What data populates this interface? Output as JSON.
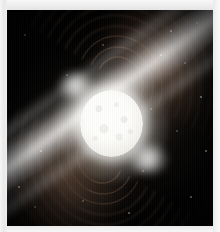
{
  "page": {
    "background_color": "#f2f2f2",
    "paper_color": "#efefef"
  },
  "figure": {
    "name": "pulsar-illustration",
    "background_color": "#000000",
    "star": {
      "name": "neutron-star-core",
      "color": "#ffffff",
      "glow_color": "#fff8e8",
      "center_x": 110,
      "center_y": 117,
      "radius": 32
    },
    "jets": [
      {
        "name": "jet-northwest",
        "direction": "upper-left",
        "angle_deg": -36,
        "color": "#ffffff"
      },
      {
        "name": "jet-southeast",
        "direction": "lower-right",
        "angle_deg": 144,
        "color": "#ffffff"
      }
    ],
    "magnetosphere": {
      "name": "magnetic-field-lobes",
      "color": "#6b523f",
      "lobes": [
        "upper-right",
        "lower-left"
      ],
      "arc_count": 9
    },
    "starfield": {
      "name": "background-stars",
      "color": "#ffffff",
      "points": [
        {
          "x": 170,
          "y": 30,
          "r": 1.1,
          "opacity": "dim"
        },
        {
          "x": 196,
          "y": 22,
          "r": 0.9,
          "opacity": "faint"
        },
        {
          "x": 184,
          "y": 62,
          "r": 0.8,
          "opacity": "faint"
        },
        {
          "x": 160,
          "y": 54,
          "r": 0.9,
          "opacity": "dim"
        },
        {
          "x": 200,
          "y": 96,
          "r": 1.0,
          "opacity": "dim"
        },
        {
          "x": 150,
          "y": 108,
          "r": 0.8,
          "opacity": "faint"
        },
        {
          "x": 176,
          "y": 130,
          "r": 0.9,
          "opacity": "faint"
        },
        {
          "x": 205,
          "y": 150,
          "r": 1.0,
          "opacity": "dim"
        },
        {
          "x": 24,
          "y": 34,
          "r": 0.9,
          "opacity": "faint"
        },
        {
          "x": 40,
          "y": 150,
          "r": 0.9,
          "opacity": "dim"
        },
        {
          "x": 18,
          "y": 186,
          "r": 1.1,
          "opacity": "dim"
        },
        {
          "x": 34,
          "y": 206,
          "r": 0.9,
          "opacity": "faint"
        },
        {
          "x": 82,
          "y": 200,
          "r": 0.9,
          "opacity": "faint"
        },
        {
          "x": 128,
          "y": 212,
          "r": 1.0,
          "opacity": "dim"
        },
        {
          "x": 66,
          "y": 74,
          "r": 0.8,
          "opacity": "faint"
        },
        {
          "x": 142,
          "y": 170,
          "r": 0.8,
          "opacity": "faint"
        },
        {
          "x": 190,
          "y": 196,
          "r": 1.0,
          "opacity": "dim"
        },
        {
          "x": 102,
          "y": 44,
          "r": 0.8,
          "opacity": "faint"
        }
      ]
    }
  },
  "margin_marks": {
    "name": "cropped-caption-smudges",
    "items": [
      {
        "x": 28,
        "y": 2,
        "w": 6,
        "h": 4
      },
      {
        "x": 60,
        "y": 3,
        "w": 10,
        "h": 3
      },
      {
        "x": 96,
        "y": 2,
        "w": 7,
        "h": 3
      },
      {
        "x": 148,
        "y": 3,
        "w": 12,
        "h": 4
      },
      {
        "x": 178,
        "y": 3,
        "w": 14,
        "h": 4
      }
    ]
  }
}
